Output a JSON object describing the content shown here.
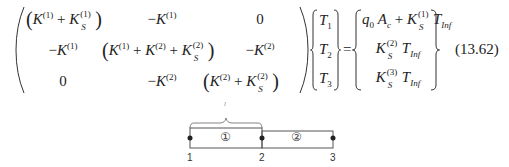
{
  "equation": {
    "number": "(13.62)",
    "matrix": {
      "rows": [
        [
          "(K^(1) + K_S^(1))",
          "-K^(1)",
          "0"
        ],
        [
          "-K^(1)",
          "(K^(1) + K^(2) + K_S^(2))",
          "-K^(2)"
        ],
        [
          "0",
          "-K^(2)",
          "(K^(2) + K_S^(2))"
        ]
      ]
    },
    "unknowns": [
      "T1",
      "T2",
      "T3"
    ],
    "equals": "=",
    "rhs": [
      "q0 Ac + K_S^(1) T_Inf",
      "K_S^(2) T_Inf",
      "K_S^(3) T_Inf"
    ],
    "glyphs": {
      "K": "K",
      "S": "S",
      "T": "T",
      "Inf": "Inf",
      "q": "q",
      "A": "A",
      "c": "c",
      "zero": "0",
      "minus": "−",
      "plus": "+",
      "s1": "(1)",
      "s2": "(2)",
      "s3": "(3)",
      "i1": "1",
      "i2": "2",
      "i3": "3",
      "i0": "0",
      "lparen": "(",
      "rparen": ")"
    }
  },
  "diagram": {
    "brace_label": "l",
    "elements": [
      "①",
      "②"
    ],
    "nodes": [
      "1",
      "2",
      "3"
    ],
    "line_color": "#555555"
  }
}
